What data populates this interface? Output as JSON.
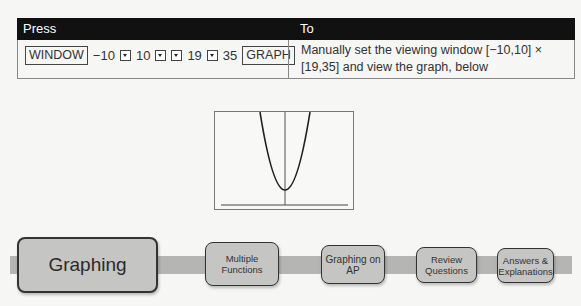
{
  "table": {
    "headers": [
      "Press",
      "To"
    ],
    "press": {
      "keys": [
        {
          "type": "key",
          "label": "WINDOW"
        },
        {
          "type": "text",
          "label": "−10"
        },
        {
          "type": "arrow",
          "icon": "down-arrow-key"
        },
        {
          "type": "text",
          "label": "10"
        },
        {
          "type": "arrow",
          "icon": "down-arrow-key"
        },
        {
          "type": "arrow",
          "icon": "down-arrow-key"
        },
        {
          "type": "text",
          "label": "19"
        },
        {
          "type": "arrow",
          "icon": "down-arrow-key"
        },
        {
          "type": "text",
          "label": "35"
        },
        {
          "type": "key",
          "label": "GRAPH"
        }
      ]
    },
    "to": "Manually set the viewing window [−10,10] × [19,35] and view the graph, below"
  },
  "graph": {
    "description": "Parabola with vertex near bottom of window, y-axis through center, x-axis line near bottom",
    "window": {
      "xmin": -10,
      "xmax": 10,
      "ymin": 19,
      "ymax": 35
    }
  },
  "nav": {
    "items": [
      {
        "label": "Graphing",
        "active": true
      },
      {
        "label": "Multiple Functions",
        "active": false
      },
      {
        "label": "Graphing on AP",
        "active": false
      },
      {
        "label": "Review Questions",
        "active": false
      },
      {
        "label": "Answers & Explanations",
        "active": false
      }
    ]
  },
  "colors": {
    "header_bg": "#111111",
    "nav_button": "#c5c5c3",
    "nav_bar": "#b5b5b3"
  }
}
